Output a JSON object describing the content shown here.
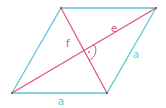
{
  "diagram": {
    "colors": {
      "sides": "#5fc8d8",
      "diagonals": "#e0507a",
      "vertex": "#555555",
      "background": "#ffffff"
    },
    "vertices": {
      "A": [
        12,
        93
      ],
      "B": [
        107,
        93
      ],
      "C": [
        156,
        8
      ],
      "D": [
        61,
        8
      ]
    },
    "labels": {
      "side_bottom": "a",
      "side_right": "a",
      "diagonal_long": "e",
      "diagonal_short": "f",
      "right_angle_dot": "·"
    }
  }
}
